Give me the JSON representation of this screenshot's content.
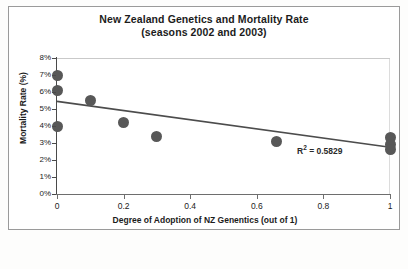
{
  "chart_data": {
    "type": "scatter",
    "title": "New Zealand Genetics and Mortality Rate",
    "subtitle": "(seasons 2002 and 2003)",
    "xlabel": "Degree of Adoption of NZ Genentics (out of 1)",
    "ylabel": "Mortality Rate (%)",
    "xlim": [
      0,
      1
    ],
    "ylim": [
      0,
      8
    ],
    "x_ticks": [
      0,
      0.2,
      0.4,
      0.6,
      0.8,
      1
    ],
    "x_tick_labels": [
      "0",
      "0.2",
      "0.4",
      "0.6",
      "0.8",
      "1"
    ],
    "y_ticks": [
      0,
      1,
      2,
      3,
      4,
      5,
      6,
      7,
      8
    ],
    "y_tick_labels": [
      "0%",
      "1%",
      "2%",
      "3%",
      "4%",
      "5%",
      "6%",
      "7%",
      "8%"
    ],
    "grid": false,
    "legend": null,
    "marker_color": "#585858",
    "trendline_color": "#4c4c4c",
    "points": [
      {
        "x": 0.0,
        "y": 7.0
      },
      {
        "x": 0.0,
        "y": 6.1
      },
      {
        "x": 0.0,
        "y": 4.0
      },
      {
        "x": 0.1,
        "y": 5.5
      },
      {
        "x": 0.2,
        "y": 4.2
      },
      {
        "x": 0.3,
        "y": 3.4
      },
      {
        "x": 0.66,
        "y": 3.1
      },
      {
        "x": 1.0,
        "y": 3.3
      },
      {
        "x": 1.0,
        "y": 2.9
      },
      {
        "x": 1.0,
        "y": 2.6
      }
    ],
    "trendline": {
      "x0": 0.0,
      "y0": 5.45,
      "x1": 1.0,
      "y1": 2.75
    },
    "annotations": [
      {
        "name": "r-squared",
        "text_prefix": "R",
        "text_sup": "2",
        "text_suffix": " = 0.5829",
        "value": 0.5829
      }
    ]
  }
}
